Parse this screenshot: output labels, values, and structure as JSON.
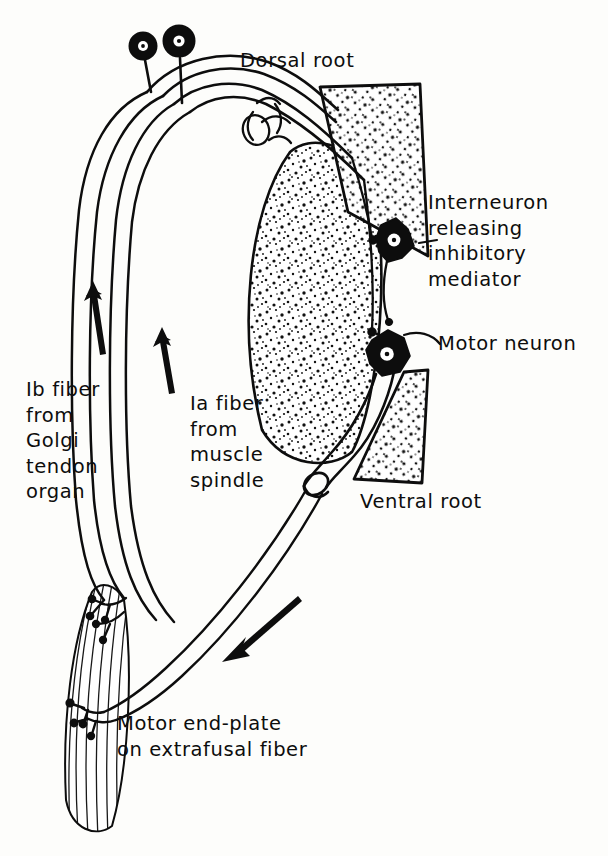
{
  "figure": {
    "background_color": "#fdfdfb",
    "ink_color": "#0d0d0d",
    "width": 608,
    "height": 856
  },
  "labels": {
    "dorsal_root": "Dorsal root",
    "ventral_root": "Ventral root",
    "interneuron": "Interneuron\nreleasing\ninhibitory\nmediator",
    "motor_neuron": "Motor neuron",
    "ib_fiber": "Ib fiber\nfrom\nGolgi\ntendon\norgan",
    "ia_fiber": "Ia fiber\nfrom\nmuscle\nspindle",
    "motor_end_plate": "Motor end-plate\non extrafusal fiber"
  },
  "structures": [
    {
      "name": "dorsal-root-ganglion-cell-left",
      "type": "ganglion-cell"
    },
    {
      "name": "dorsal-root-ganglion-cell-right",
      "type": "ganglion-cell"
    },
    {
      "name": "dorsal-horn-gray-matter",
      "type": "stippled-horn"
    },
    {
      "name": "ventral-horn-gray-matter",
      "type": "stippled-horn"
    },
    {
      "name": "central-gray-matter",
      "type": "stippled-mass"
    },
    {
      "name": "interneuron-soma",
      "type": "filled-stellate-neuron"
    },
    {
      "name": "motor-neuron-soma",
      "type": "filled-stellate-neuron"
    },
    {
      "name": "dorsal-root-nerve-trunk",
      "type": "nerve-bundle"
    },
    {
      "name": "ventral-root-nerve-trunk",
      "type": "nerve-bundle"
    },
    {
      "name": "skeletal-muscle-belly",
      "type": "striated-muscle"
    }
  ],
  "arrows": [
    {
      "name": "arrow-ib-afferent",
      "direction": "up",
      "meaning": "Ib impulse travelling toward cord"
    },
    {
      "name": "arrow-ia-afferent",
      "direction": "up",
      "meaning": "Ia impulse travelling toward cord"
    },
    {
      "name": "arrow-efferent",
      "direction": "down-left",
      "meaning": "Motor impulse travelling to muscle"
    }
  ]
}
